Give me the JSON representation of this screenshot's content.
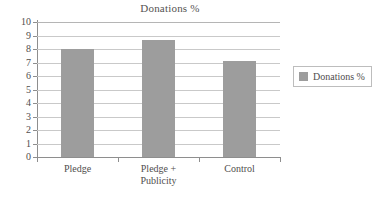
{
  "chart_data": {
    "type": "bar",
    "title": "Donations %",
    "xlabel": "",
    "ylabel": "",
    "categories": [
      "Pledge",
      "Pledge +\nPublicity",
      "Control"
    ],
    "values": [
      8.0,
      8.7,
      7.1
    ],
    "series": [
      {
        "name": "Donations %",
        "values": [
          8.0,
          8.7,
          7.1
        ]
      }
    ],
    "ylim": [
      0,
      10
    ],
    "ytick_step": 1,
    "yticks": [
      10,
      9,
      8,
      7,
      6,
      5,
      4,
      3,
      2,
      1,
      0
    ],
    "grid": true,
    "legend_position": "right",
    "legend_entries": [
      "Donations %"
    ],
    "bar_color": "#9d9d9d",
    "gridline_color": "#c9c9c9",
    "axis_color": "#8e8e8e",
    "background": "#ffffff"
  },
  "legend": {
    "swatch_name": "legend-color-swatch",
    "label": "Donations %"
  }
}
